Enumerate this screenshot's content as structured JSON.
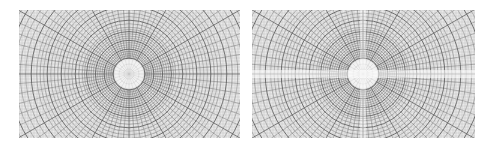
{
  "figure": {
    "panels": [
      {
        "id": "left",
        "description": "Polar grid pattern (radial lines and concentric circles), no artifacts",
        "center": [
          110,
          64
        ],
        "has_artifacts": false
      },
      {
        "id": "right",
        "description": "Polar grid pattern with horizontal and vertical aliasing/artifact streaks through center",
        "center": [
          111,
          64
        ],
        "has_artifacts": true
      }
    ],
    "colors": {
      "background": "#ffffff",
      "grid_line": "#555555",
      "panel_fill": "#e9e9e9",
      "center_disc": "#f4f4f4"
    }
  }
}
